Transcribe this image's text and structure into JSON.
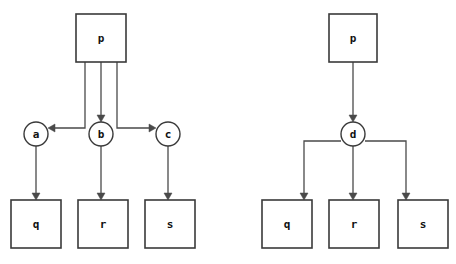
{
  "canvas": {
    "width": 456,
    "height": 264,
    "background": "#ffffff",
    "stroke_color": "#3a3a3a",
    "edge_color": "#4a4a4a",
    "label_color": "#111111"
  },
  "diagrams": [
    {
      "id": "left-diagram",
      "name": "fan-out-through-three-intermediates",
      "nodes": [
        {
          "id": "l-p",
          "label": "p",
          "shape": "rect",
          "x": 76,
          "y": 14,
          "w": 50,
          "h": 48
        },
        {
          "id": "l-a",
          "label": "a",
          "shape": "circle",
          "cx": 36,
          "cy": 134,
          "r": 12
        },
        {
          "id": "l-b",
          "label": "b",
          "shape": "circle",
          "cx": 101,
          "cy": 134,
          "r": 12
        },
        {
          "id": "l-c",
          "label": "c",
          "shape": "circle",
          "cx": 168,
          "cy": 134,
          "r": 12
        },
        {
          "id": "l-q",
          "label": "q",
          "shape": "rect",
          "x": 11,
          "y": 200,
          "w": 50,
          "h": 48
        },
        {
          "id": "l-r",
          "label": "r",
          "shape": "rect",
          "x": 78,
          "y": 200,
          "w": 50,
          "h": 48
        },
        {
          "id": "l-s",
          "label": "s",
          "shape": "rect",
          "x": 145,
          "y": 200,
          "w": 50,
          "h": 48
        }
      ],
      "edges": [
        {
          "id": "l-p-a",
          "from": "p",
          "to": "a",
          "path": "M 85 62 L 85 128 L 52 128",
          "arrow": "left",
          "ax": 48,
          "ay": 128
        },
        {
          "id": "l-p-b",
          "from": "p",
          "to": "b",
          "path": "M 101 62 L 101 118",
          "arrow": "down",
          "ax": 101,
          "ay": 122
        },
        {
          "id": "l-p-c",
          "from": "p",
          "to": "c",
          "path": "M 117 62 L 117 128 L 152 128",
          "arrow": "right",
          "ax": 156,
          "ay": 128
        },
        {
          "id": "l-a-q",
          "from": "a",
          "to": "q",
          "path": "M 36 146 L 36 196",
          "arrow": "down",
          "ax": 36,
          "ay": 200
        },
        {
          "id": "l-b-r",
          "from": "b",
          "to": "r",
          "path": "M 101 146 L 101 196",
          "arrow": "down",
          "ax": 101,
          "ay": 200
        },
        {
          "id": "l-c-s",
          "from": "c",
          "to": "s",
          "path": "M 168 146 L 168 196",
          "arrow": "down",
          "ax": 168,
          "ay": 200
        }
      ]
    },
    {
      "id": "right-diagram",
      "name": "fan-out-through-single-intermediate",
      "nodes": [
        {
          "id": "r-p",
          "label": "p",
          "shape": "rect",
          "x": 329,
          "y": 14,
          "w": 48,
          "h": 48
        },
        {
          "id": "r-d",
          "label": "d",
          "shape": "circle",
          "cx": 353,
          "cy": 134,
          "r": 12
        },
        {
          "id": "r-q",
          "label": "q",
          "shape": "rect",
          "x": 262,
          "y": 200,
          "w": 50,
          "h": 48
        },
        {
          "id": "r-r",
          "label": "r",
          "shape": "rect",
          "x": 329,
          "y": 200,
          "w": 50,
          "h": 48
        },
        {
          "id": "r-s",
          "label": "s",
          "shape": "rect",
          "x": 398,
          "y": 200,
          "w": 50,
          "h": 48
        }
      ],
      "edges": [
        {
          "id": "r-p-d",
          "from": "p",
          "to": "d",
          "path": "M 353 62 L 353 118",
          "arrow": "down",
          "ax": 353,
          "ay": 122
        },
        {
          "id": "r-d-q",
          "from": "d",
          "to": "q",
          "path": "M 341 141 L 304 141 L 304 196",
          "arrow": "down",
          "ax": 304,
          "ay": 200
        },
        {
          "id": "r-d-r",
          "from": "d",
          "to": "r",
          "path": "M 353 146 L 353 196",
          "arrow": "down",
          "ax": 353,
          "ay": 200
        },
        {
          "id": "r-d-s",
          "from": "d",
          "to": "s",
          "path": "M 365 141 L 406 141 L 406 196",
          "arrow": "down",
          "ax": 406,
          "ay": 200
        }
      ]
    }
  ]
}
